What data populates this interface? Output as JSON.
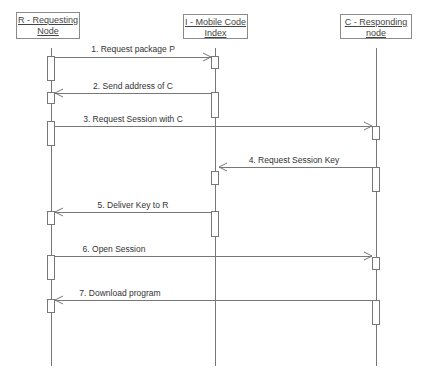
{
  "participants": [
    {
      "id": "R",
      "label_line1": "R - Requesting",
      "label_line2": "Node"
    },
    {
      "id": "I",
      "label_line1": "I - Mobile Code",
      "label_line2": "Index"
    },
    {
      "id": "C",
      "label_line1": "C - Responding",
      "label_line2": "node"
    }
  ],
  "messages": [
    {
      "n": 1,
      "label": "1. Request package P",
      "from": "R",
      "to": "I"
    },
    {
      "n": 2,
      "label": "2. Send address of C",
      "from": "I",
      "to": "R"
    },
    {
      "n": 3,
      "label": "3. Request Session with C",
      "from": "R",
      "to": "C"
    },
    {
      "n": 4,
      "label": "4. Request Session Key",
      "from": "C",
      "to": "I"
    },
    {
      "n": 5,
      "label": "5. Deliver Key to R",
      "from": "I",
      "to": "R"
    },
    {
      "n": 6,
      "label": "6. Open Session",
      "from": "R",
      "to": "C"
    },
    {
      "n": 7,
      "label": "7. Download program",
      "from": "C",
      "to": "R"
    }
  ],
  "colors": {
    "line": "#777777",
    "text": "#333333",
    "background": "#ffffff"
  }
}
